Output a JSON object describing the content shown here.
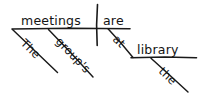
{
  "diagram": {
    "type": "reed-kellogg-sentence-diagram",
    "sentence": "The group's meetings are at the library.",
    "ink_color": "#1a1a1a",
    "background_color": "#ffffff",
    "subject": {
      "word": "meetings",
      "role": "subject",
      "modifiers": [
        {
          "word": "The",
          "role": "article",
          "slant": "down-right"
        },
        {
          "word": "group's",
          "role": "possessive-modifier",
          "slant": "down-right"
        }
      ]
    },
    "predicate": {
      "word": "are",
      "role": "linking-verb"
    },
    "prepositional_phrase": {
      "preposition": "at",
      "object": "library",
      "object_modifiers": [
        {
          "word": "the",
          "role": "article",
          "slant": "down-right"
        }
      ]
    },
    "lines": {
      "baseline_label": "main-baseline",
      "divider_label": "subject-verb-divider",
      "prep_slant_label": "preposition-slant",
      "object_line_label": "preposition-object-line"
    }
  }
}
